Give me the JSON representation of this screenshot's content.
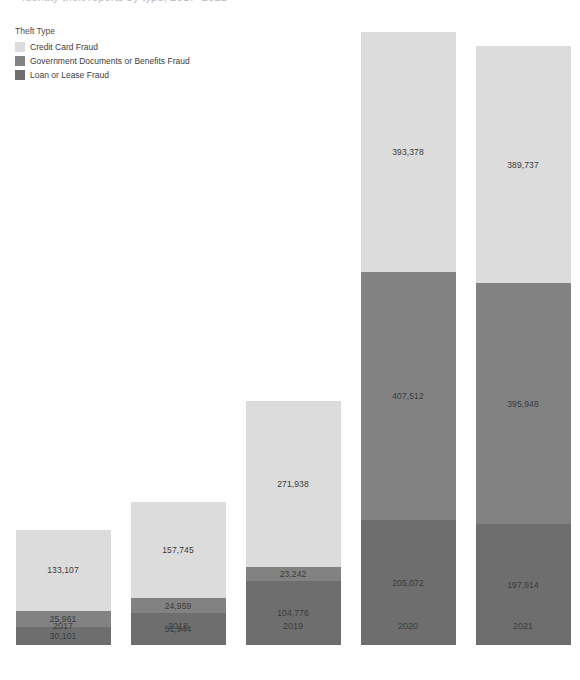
{
  "title": {
    "clipped_text": "Identity theft reports by type, 2017–2021"
  },
  "legend": {
    "title": "Theft Type",
    "items": [
      {
        "label": "Credit Card Fraud",
        "color": "#dcdcdc",
        "key": "credit_card"
      },
      {
        "label": "Government Documents or Benefits Fraud",
        "color": "#828282",
        "key": "government"
      },
      {
        "label": "Loan or Lease Fraud",
        "color": "#6e6e6e",
        "key": "loan_lease"
      }
    ]
  },
  "chart_data": {
    "type": "bar",
    "stacked": true,
    "orientation": "vertical",
    "title": "Identity theft reports by type, 2017–2021",
    "xlabel": "",
    "ylabel": "",
    "grid": false,
    "legend_position": "top-left",
    "legend_title": "Theft Type",
    "categories": [
      "2017",
      "2018",
      "2019",
      "2020",
      "2021"
    ],
    "stack_order_bottom_to_top": [
      "Loan or Lease Fraud",
      "Government Documents or Benefits Fraud",
      "Credit Card Fraud"
    ],
    "series": [
      {
        "name": "Credit Card Fraud",
        "color": "#dcdcdc",
        "values": [
          133107,
          157745,
          271938,
          393378,
          389737
        ],
        "labels": [
          "133,107",
          "157,745",
          "271,938",
          "393,378",
          "389,737"
        ]
      },
      {
        "name": "Government Documents or Benefits Fraud",
        "color": "#828282",
        "values": [
          25961,
          24959,
          23242,
          407512,
          395948
        ],
        "labels": [
          "25,961",
          "24,959",
          "23,242",
          "407,512",
          "395,948"
        ]
      },
      {
        "name": "Loan or Lease Fraud",
        "color": "#6e6e6e",
        "values": [
          30101,
          51944,
          104776,
          205072,
          197914
        ],
        "labels": [
          "30,101",
          "51,944",
          "104,776",
          "205,072",
          "197,914"
        ]
      }
    ],
    "totals": [
      189169,
      234648,
      399956,
      1005962,
      983599
    ],
    "ylim": [
      0,
      1005962
    ],
    "tick_labels": [
      "2017",
      "2018",
      "2019",
      "2020",
      "2021"
    ]
  },
  "layout": {
    "bar_width_px": 95,
    "bar_centers_px": [
      63,
      178,
      293,
      408,
      523
    ],
    "baseline_y_px": 645,
    "plot_top_y_px": 32,
    "units_per_px": 1642
  }
}
